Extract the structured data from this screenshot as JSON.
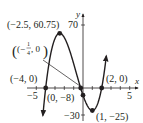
{
  "chart_data": {
    "type": "line",
    "title": "",
    "function": "f(x) = (x + 4)(4x + 1)(x - 2)",
    "xlabel": "x",
    "ylabel": "y",
    "xlim": [
      -5.5,
      5.5
    ],
    "ylim": [
      -35,
      75
    ],
    "x_ticks": [
      -5,
      -4,
      -3,
      -2,
      -1,
      1,
      2,
      3,
      4,
      5
    ],
    "x_tick_labels": [
      "-5",
      "5"
    ],
    "y_tick_labels": [
      "70",
      "-30"
    ],
    "grid": false,
    "points": [
      {
        "x": -2.5,
        "y": 60.75,
        "label": "(−2.5, 60.75)"
      },
      {
        "x": -4,
        "y": 0,
        "label": "(−4, 0)"
      },
      {
        "x": -0.25,
        "y": 0,
        "label": "(−¼, 0)"
      },
      {
        "x": 0,
        "y": -8,
        "label": "(0, −8)"
      },
      {
        "x": 2,
        "y": 0,
        "label": "(2, 0)"
      },
      {
        "x": 1,
        "y": -25,
        "label": "(1, −25)"
      }
    ],
    "curve_color": "#231f20"
  },
  "labels": {
    "max_point": "(−2.5, 60.75)",
    "root_left": "(−4, 0)",
    "root_mid_prefix": "(−",
    "root_mid_num": "1",
    "root_mid_den": "4",
    "root_mid_suffix": ", 0)",
    "y_intercept": "(0, −8)",
    "root_right": "(2, 0)",
    "min_point": "(1, −25)",
    "x_axis": "x",
    "y_axis": "y",
    "tick_neg5": "−5",
    "tick_5": "5",
    "tick_70": "70",
    "tick_neg30": "−30"
  }
}
